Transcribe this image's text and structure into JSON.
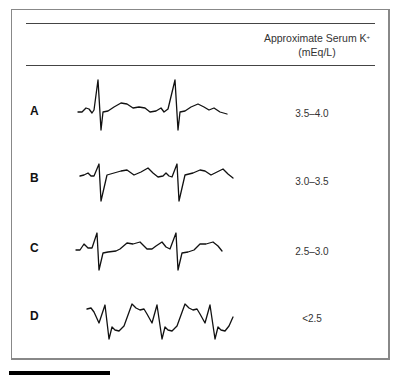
{
  "table": {
    "column_header_line1": "Approximate Serum K",
    "column_header_superscript": "+",
    "column_header_line2": "(mEq/L)",
    "rows": [
      {
        "label": "A",
        "value": "3.5–4.0"
      },
      {
        "label": "B",
        "value": "3.0–3.5"
      },
      {
        "label": "C",
        "value": "2.5–3.0"
      },
      {
        "label": "D",
        "value": "<2.5"
      }
    ]
  }
}
